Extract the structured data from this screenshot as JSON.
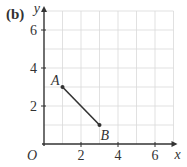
{
  "part_label": "(b)",
  "chart_data": {
    "type": "line",
    "title": "",
    "xlabel": "x",
    "ylabel": "y",
    "origin_label": "O",
    "xlim": [
      0,
      7
    ],
    "ylim": [
      0,
      7
    ],
    "x_ticks": [
      2,
      4,
      6
    ],
    "y_ticks": [
      2,
      4,
      6
    ],
    "grid": true,
    "grid_step": 1,
    "points": [
      {
        "label": "A",
        "x": 1,
        "y": 3
      },
      {
        "label": "B",
        "x": 3,
        "y": 1
      }
    ],
    "segments": [
      {
        "from": "A",
        "to": "B"
      }
    ]
  },
  "colors": {
    "axis": "#333333",
    "grid": "#d9d9d9",
    "segment": "#333333",
    "text": "#333333"
  }
}
